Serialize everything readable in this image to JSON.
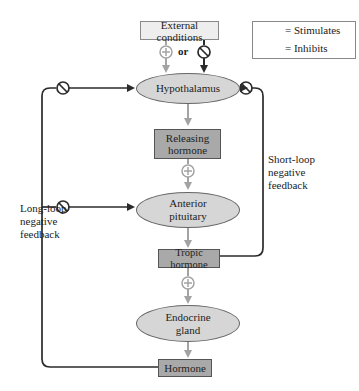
{
  "diagram": {
    "nodes": {
      "external_conditions": "External conditions",
      "hypothalamus": "Hypothalamus",
      "releasing_hormone": "Releasing hormone",
      "anterior_pituitary": "Anterior pituitary",
      "tropic_hormone": "Tropic hormone",
      "endocrine_gland": "Endocrine gland",
      "hormone": "Hormone"
    },
    "connector_or": "or",
    "labels": {
      "long_loop": "Long-loop negative feedback",
      "short_loop": "Short-loop negative feedback"
    },
    "legend": {
      "stimulates": "= Stimulates",
      "inhibits": "= Inhibits"
    },
    "colors": {
      "stimulate_arrow": "#a3a3a3",
      "inhibit_arrow": "#2b2b2b",
      "ellipse_fill": "#d6d6d6",
      "dark_box_fill": "#a9a9a9",
      "light_box_fill": "#eeeeee"
    }
  }
}
